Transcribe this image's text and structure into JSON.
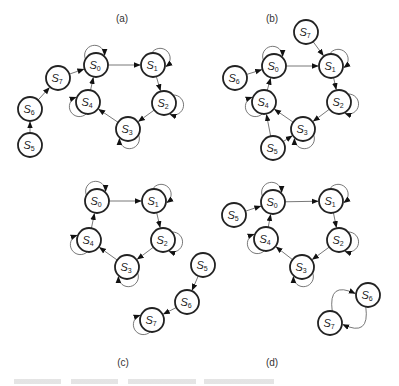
{
  "figure": {
    "node_radius": 12,
    "stroke_color": "#222222",
    "edge_color": "#555555",
    "panels": [
      {
        "id": "a",
        "label": "(a)",
        "label_pos": [
          122,
          20
        ],
        "nodes": [
          {
            "id": "S0",
            "sub": "0",
            "x": 96,
            "y": 65
          },
          {
            "id": "S1",
            "sub": "1",
            "x": 153,
            "y": 65
          },
          {
            "id": "S2",
            "sub": "2",
            "x": 164,
            "y": 103
          },
          {
            "id": "S3",
            "sub": "3",
            "x": 128,
            "y": 129
          },
          {
            "id": "S4",
            "sub": "4",
            "x": 88,
            "y": 102
          },
          {
            "id": "S7",
            "sub": "7",
            "x": 58,
            "y": 78
          },
          {
            "id": "S6",
            "sub": "6",
            "x": 30,
            "y": 109
          },
          {
            "id": "S5",
            "sub": "5",
            "x": 30,
            "y": 145
          }
        ],
        "edges": [
          [
            "S0",
            "S1"
          ],
          [
            "S1",
            "S2"
          ],
          [
            "S2",
            "S3"
          ],
          [
            "S3",
            "S4"
          ],
          [
            "S4",
            "S0"
          ],
          [
            "S7",
            "S0"
          ],
          [
            "S6",
            "S7"
          ],
          [
            "S5",
            "S6"
          ]
        ],
        "loops": [
          {
            "node": "S0",
            "dir": "up"
          },
          {
            "node": "S1",
            "dir": "upright"
          },
          {
            "node": "S2",
            "dir": "right"
          },
          {
            "node": "S3",
            "dir": "down"
          },
          {
            "node": "S4",
            "dir": "downleft"
          }
        ]
      },
      {
        "id": "b",
        "label": "(b)",
        "label_pos": [
          272,
          20
        ],
        "nodes": [
          {
            "id": "S0",
            "sub": "0",
            "x": 274,
            "y": 66
          },
          {
            "id": "S1",
            "sub": "1",
            "x": 331,
            "y": 66
          },
          {
            "id": "S2",
            "sub": "2",
            "x": 339,
            "y": 102
          },
          {
            "id": "S3",
            "sub": "3",
            "x": 303,
            "y": 129
          },
          {
            "id": "S4",
            "sub": "4",
            "x": 264,
            "y": 102
          },
          {
            "id": "S6",
            "sub": "6",
            "x": 235,
            "y": 78
          },
          {
            "id": "S7",
            "sub": "7",
            "x": 306,
            "y": 32
          },
          {
            "id": "S5",
            "sub": "5",
            "x": 273,
            "y": 148
          }
        ],
        "edges": [
          [
            "S0",
            "S1"
          ],
          [
            "S1",
            "S2"
          ],
          [
            "S2",
            "S3"
          ],
          [
            "S3",
            "S4"
          ],
          [
            "S4",
            "S0"
          ],
          [
            "S6",
            "S0"
          ],
          [
            "S7",
            "S1"
          ],
          [
            "S5",
            "S4"
          ],
          [
            "S5",
            "S3"
          ]
        ],
        "loops": [
          {
            "node": "S0",
            "dir": "up"
          },
          {
            "node": "S1",
            "dir": "upright"
          },
          {
            "node": "S2",
            "dir": "right"
          },
          {
            "node": "S3",
            "dir": "down"
          },
          {
            "node": "S4",
            "dir": "downleft"
          }
        ]
      },
      {
        "id": "c",
        "label": "(c)",
        "label_pos": [
          123,
          364
        ],
        "nodes": [
          {
            "id": "S0",
            "sub": "0",
            "x": 97,
            "y": 201
          },
          {
            "id": "S1",
            "sub": "1",
            "x": 154,
            "y": 201
          },
          {
            "id": "S2",
            "sub": "2",
            "x": 163,
            "y": 240
          },
          {
            "id": "S3",
            "sub": "3",
            "x": 127,
            "y": 267
          },
          {
            "id": "S4",
            "sub": "4",
            "x": 89,
            "y": 240
          },
          {
            "id": "S5",
            "sub": "5",
            "x": 203,
            "y": 265
          },
          {
            "id": "S6",
            "sub": "6",
            "x": 187,
            "y": 302
          },
          {
            "id": "S7",
            "sub": "7",
            "x": 152,
            "y": 320
          }
        ],
        "edges": [
          [
            "S0",
            "S1"
          ],
          [
            "S1",
            "S2"
          ],
          [
            "S2",
            "S3"
          ],
          [
            "S3",
            "S4"
          ],
          [
            "S4",
            "S0"
          ],
          [
            "S5",
            "S6"
          ],
          [
            "S6",
            "S7"
          ]
        ],
        "loops": [
          {
            "node": "S0",
            "dir": "up"
          },
          {
            "node": "S1",
            "dir": "upright"
          },
          {
            "node": "S2",
            "dir": "right"
          },
          {
            "node": "S3",
            "dir": "down"
          },
          {
            "node": "S4",
            "dir": "downleft"
          },
          {
            "node": "S7",
            "dir": "downleft"
          }
        ]
      },
      {
        "id": "d",
        "label": "(d)",
        "label_pos": [
          272,
          364
        ],
        "nodes": [
          {
            "id": "S0",
            "sub": "0",
            "x": 273,
            "y": 202
          },
          {
            "id": "S1",
            "sub": "1",
            "x": 331,
            "y": 201
          },
          {
            "id": "S2",
            "sub": "2",
            "x": 339,
            "y": 240
          },
          {
            "id": "S3",
            "sub": "3",
            "x": 302,
            "y": 267
          },
          {
            "id": "S4",
            "sub": "4",
            "x": 266,
            "y": 239
          },
          {
            "id": "S5",
            "sub": "5",
            "x": 234,
            "y": 215
          },
          {
            "id": "S6",
            "sub": "6",
            "x": 368,
            "y": 295
          },
          {
            "id": "S7",
            "sub": "7",
            "x": 330,
            "y": 323
          }
        ],
        "edges": [
          [
            "S0",
            "S1"
          ],
          [
            "S1",
            "S2"
          ],
          [
            "S2",
            "S3"
          ],
          [
            "S3",
            "S4"
          ],
          [
            "S4",
            "S0"
          ],
          [
            "S5",
            "S0"
          ]
        ],
        "curved_edges": [
          {
            "from": "S7",
            "to": "S6",
            "bend": -1
          },
          {
            "from": "S6",
            "to": "S7",
            "bend": -1
          }
        ],
        "loops": [
          {
            "node": "S0",
            "dir": "up"
          },
          {
            "node": "S1",
            "dir": "upright"
          },
          {
            "node": "S2",
            "dir": "right"
          },
          {
            "node": "S3",
            "dir": "down"
          },
          {
            "node": "S4",
            "dir": "downleft"
          }
        ]
      }
    ]
  }
}
